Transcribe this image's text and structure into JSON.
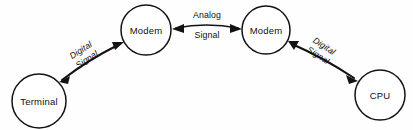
{
  "diagram": {
    "background_color": "#fefefe",
    "stroke_color": "#131313",
    "nodes": [
      {
        "id": "terminal",
        "label": "Terminal",
        "shape": "circle",
        "cx": 39,
        "cy": 101,
        "r": 27
      },
      {
        "id": "modem-left",
        "label": "Modem",
        "shape": "circle",
        "cx": 146,
        "cy": 30,
        "r": 25
      },
      {
        "id": "modem-right",
        "label": "Modem",
        "shape": "circle",
        "cx": 266,
        "cy": 30,
        "r": 24
      },
      {
        "id": "cpu",
        "label": "CPU",
        "shape": "circle",
        "cx": 380,
        "cy": 95,
        "r": 25
      }
    ],
    "links": [
      {
        "id": "link-terminal-modem",
        "from": "terminal",
        "to": "modem-left",
        "label_line1": "Digital",
        "label_line2": "Signal",
        "orientation": "rotated",
        "rotation_deg": -33,
        "arrowheads": "both"
      },
      {
        "id": "link-modem-modem",
        "from": "modem-left",
        "to": "modem-right",
        "label_line1": "Analog",
        "label_line2": "Signal",
        "orientation": "horizontal",
        "rotation_deg": 0,
        "arrowheads": "both"
      },
      {
        "id": "link-modem-cpu",
        "from": "modem-right",
        "to": "cpu",
        "label_line1": "Digital",
        "label_line2": "Signal",
        "orientation": "rotated",
        "rotation_deg": 33,
        "arrowheads": "both"
      }
    ]
  }
}
